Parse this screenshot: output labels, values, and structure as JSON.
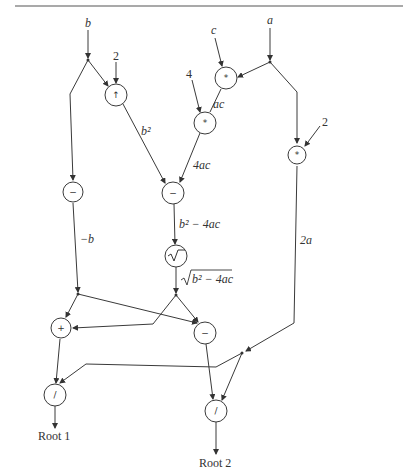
{
  "diagram": {
    "inputs": {
      "b": "b",
      "c": "c",
      "a": "a",
      "two_top": "2",
      "four": "4",
      "two_right": "2"
    },
    "operators": {
      "power": "↑",
      "mul_ac": "*",
      "mul_4ac": "*",
      "mul_2a": "*",
      "neg_b": "−",
      "sub_disc": "−",
      "sqrt": "√",
      "add": "+",
      "sub": "−",
      "div1": "/",
      "div2": "/"
    },
    "edge_labels": {
      "b_squared": "b²",
      "ac": "ac",
      "four_ac": "4ac",
      "neg_b": "−b",
      "discriminant": "b² − 4ac",
      "sqrt_discriminant": "b² − 4ac",
      "two_a": "2a"
    },
    "outputs": {
      "root1": "Root 1",
      "root2": "Root 2"
    }
  }
}
